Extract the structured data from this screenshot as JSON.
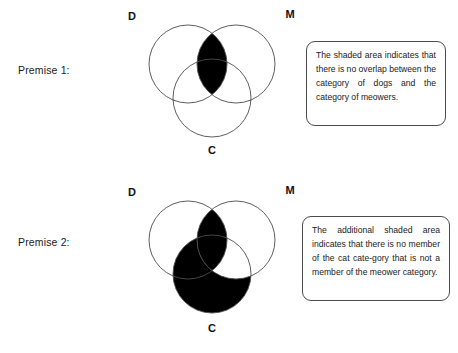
{
  "page": {
    "background_color": "#ffffff",
    "stroke_color": "#4c4c4c",
    "shade_color": "#000000",
    "text_color": "#1a1a1a"
  },
  "premises": [
    {
      "label": "Premise 1:",
      "diagram": {
        "type": "venn-3-circle",
        "circle_labels": {
          "left": "D",
          "right": "M",
          "bottom": "C"
        },
        "shaded_regions": [
          "D-and-M"
        ]
      },
      "callout": {
        "text": "The shaded area indicates that there is no overlap between the category of dogs and the category of meowers."
      }
    },
    {
      "label": "Premise 2:",
      "diagram": {
        "type": "venn-3-circle",
        "circle_labels": {
          "left": "D",
          "right": "M",
          "bottom": "C"
        },
        "shaded_regions": [
          "D-and-M",
          "C-not-M"
        ]
      },
      "callout": {
        "text": "The additional shaded area indicates that there is no member of the cat cate‐gory that is not a member of the meower category."
      }
    }
  ]
}
